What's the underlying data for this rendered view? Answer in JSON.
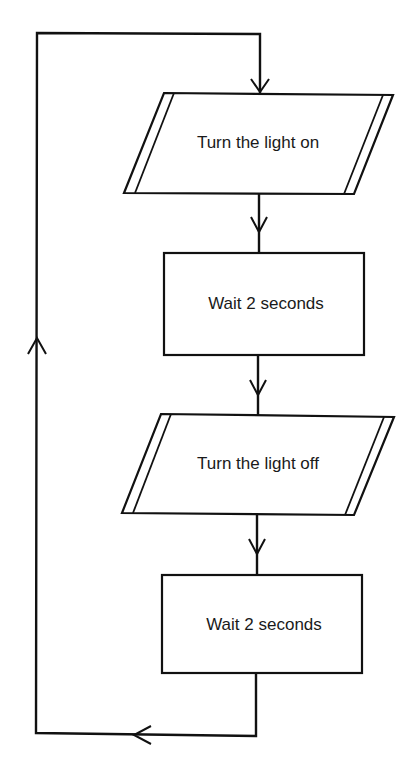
{
  "diagram": {
    "type": "flowchart",
    "colors": {
      "stroke": "#111111",
      "background": "#ffffff",
      "text": "#1a1a1a"
    },
    "nodes": [
      {
        "id": "n1",
        "shape": "parallelogram-io",
        "label": "Turn the light on"
      },
      {
        "id": "n2",
        "shape": "rectangle-process",
        "label": "Wait 2 seconds"
      },
      {
        "id": "n3",
        "shape": "parallelogram-io",
        "label": "Turn the light off"
      },
      {
        "id": "n4",
        "shape": "rectangle-process",
        "label": "Wait 2 seconds"
      }
    ],
    "edges": [
      {
        "from": "n1",
        "to": "n2"
      },
      {
        "from": "n2",
        "to": "n3"
      },
      {
        "from": "n3",
        "to": "n4"
      },
      {
        "from": "n4",
        "to": "n1",
        "style": "loop-back-left"
      }
    ]
  }
}
